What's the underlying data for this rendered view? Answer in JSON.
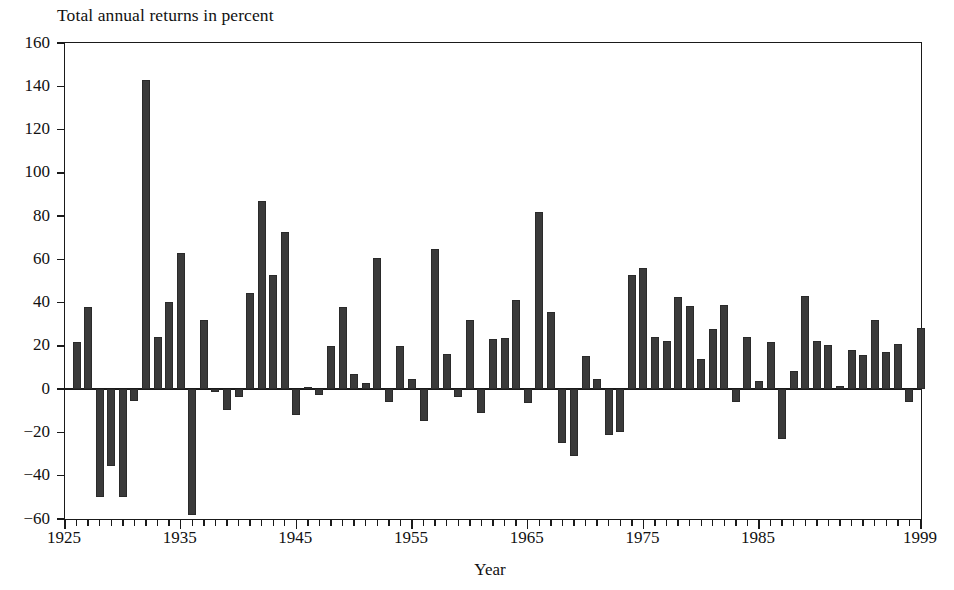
{
  "chart_data": {
    "type": "bar",
    "title": "Total annual returns in percent",
    "xlabel": "Year",
    "ylabel": "",
    "xlim": [
      1925,
      1999
    ],
    "ylim": [
      -60,
      160
    ],
    "ytick_labels": [
      "160",
      "140",
      "120",
      "100",
      "80",
      "60",
      "40",
      "20",
      "0",
      "−20",
      "−40",
      "−60"
    ],
    "ytick_values": [
      160,
      140,
      120,
      100,
      80,
      60,
      40,
      20,
      0,
      -20,
      -40,
      -60
    ],
    "xtick_labels": [
      "1925",
      "1935",
      "1945",
      "1955",
      "1965",
      "1975",
      "1985",
      "1999"
    ],
    "xtick_values": [
      1925,
      1935,
      1945,
      1955,
      1965,
      1975,
      1985,
      1999
    ],
    "grid": false,
    "legend": false,
    "bar_color": "#3a3a3a",
    "axis_color": "#1a1a1a",
    "categories": [
      1926,
      1927,
      1928,
      1929,
      1930,
      1931,
      1932,
      1933,
      1934,
      1935,
      1936,
      1937,
      1938,
      1939,
      1940,
      1941,
      1942,
      1943,
      1944,
      1945,
      1946,
      1947,
      1948,
      1949,
      1950,
      1951,
      1952,
      1953,
      1954,
      1955,
      1956,
      1957,
      1958,
      1959,
      1960,
      1961,
      1962,
      1963,
      1964,
      1965,
      1966,
      1967,
      1968,
      1969,
      1970,
      1971,
      1972,
      1973,
      1974,
      1975,
      1976,
      1977,
      1978,
      1979,
      1980,
      1981,
      1982,
      1983,
      1984,
      1985,
      1986,
      1987,
      1988,
      1989,
      1990,
      1991,
      1992,
      1993,
      1994,
      1995,
      1996,
      1997,
      1998,
      1999
    ],
    "values": [
      21.7,
      37.9,
      -50.0,
      -35.3,
      -49.8,
      -5.4,
      142.9,
      24.2,
      40.2,
      63.0,
      -58.0,
      32.2,
      -1.5,
      -9.5,
      -3.5,
      44.5,
      87.0,
      53.0,
      72.8,
      -12.0,
      1.0,
      -2.5,
      20.0,
      37.9,
      7.0,
      3.0,
      60.6,
      -6.0,
      19.8,
      4.5,
      -14.6,
      64.6,
      16.3,
      -3.8,
      32.0,
      -11.0,
      23.0,
      23.6,
      41.2,
      -6.5,
      82.0,
      35.6,
      -25.0,
      -31.0,
      15.5,
      4.5,
      -21.0,
      -20.0,
      52.8,
      56.0,
      24.0,
      22.5,
      42.5,
      38.5,
      13.9,
      28.0,
      38.8,
      -6.0,
      24.0,
      4.0,
      22.0,
      -22.9,
      8.5,
      43.0,
      22.4,
      20.3,
      1.5,
      18.0,
      15.6,
      31.9,
      17.0,
      21.0,
      -6.0,
      28.5
    ],
    "notes": {
      "bar_count": 74,
      "first_year": 1926,
      "last_year": 1999,
      "max_value": 142.9,
      "max_year": 1933,
      "min_value": -58.0,
      "min_year": 1937
    }
  }
}
